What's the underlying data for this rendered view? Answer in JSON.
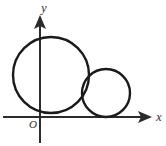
{
  "figure": {
    "background_color": "#ffffff",
    "stroke_color": "#1a1a1a",
    "axis_color": "#2b2b2b"
  },
  "axes": {
    "x_axis": {
      "label": "x",
      "name": "x-axis",
      "start_x": 3,
      "end_x": 152,
      "y": 117,
      "arrow": "right"
    },
    "y_axis": {
      "label": "y",
      "name": "y-axis",
      "x": 40,
      "start_y": 143,
      "end_y": 19,
      "arrow": "up"
    },
    "origin": {
      "label": "O",
      "x": 40,
      "y": 117
    }
  },
  "shapes": [
    {
      "name": "large-circle",
      "type": "circle",
      "cx": 51,
      "cy": 75,
      "r": 38,
      "stroke_width": 2.4
    },
    {
      "name": "small-circle",
      "type": "circle",
      "cx": 106,
      "cy": 93,
      "r": 24,
      "stroke_width": 2.4
    }
  ]
}
